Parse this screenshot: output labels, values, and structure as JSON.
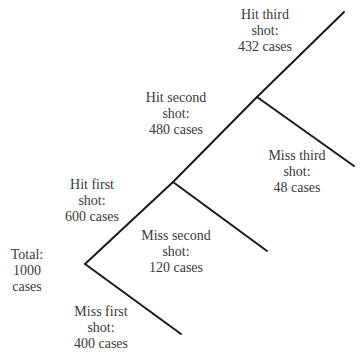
{
  "diagram": {
    "type": "probability-tree",
    "line_color": "#1a1a1a",
    "text_color": "#3a3a3a",
    "nodes": {
      "total": {
        "line1": "Total:",
        "line2": "1000",
        "line3": "cases"
      },
      "hit_first": {
        "line1": "Hit first",
        "line2": "shot:",
        "line3": "600 cases"
      },
      "miss_first": {
        "line1": "Miss first",
        "line2": "shot:",
        "line3": "400 cases"
      },
      "hit_second": {
        "line1": "Hit second",
        "line2": "shot:",
        "line3": "480 cases"
      },
      "miss_second": {
        "line1": "Miss second",
        "line2": "shot:",
        "line3": "120 cases"
      },
      "hit_third": {
        "line1": "Hit third",
        "line2": "shot:",
        "line3": "432 cases"
      },
      "miss_third": {
        "line1": "Miss third",
        "line2": "shot:",
        "line3": "48 cases"
      }
    },
    "branches": [
      {
        "from": "total",
        "to": "hit_first",
        "count": 600
      },
      {
        "from": "total",
        "to": "miss_first",
        "count": 400
      },
      {
        "from": "hit_first",
        "to": "hit_second",
        "count": 480
      },
      {
        "from": "hit_first",
        "to": "miss_second",
        "count": 120
      },
      {
        "from": "hit_second",
        "to": "hit_third",
        "count": 432
      },
      {
        "from": "hit_second",
        "to": "miss_third",
        "count": 48
      }
    ]
  }
}
